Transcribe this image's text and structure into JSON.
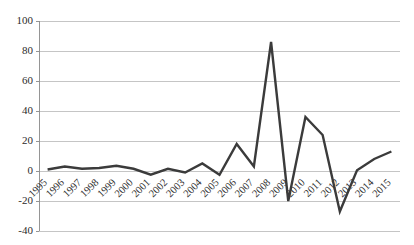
{
  "chart_data": {
    "type": "line",
    "title": "",
    "subtitle": "",
    "xlabel": "",
    "ylabel": "",
    "categories": [
      "1995",
      "1996",
      "1997",
      "1998",
      "1999",
      "2000",
      "2001",
      "2002",
      "2003",
      "2004",
      "2005",
      "2006",
      "2007",
      "2008",
      "2009",
      "2010",
      "2011",
      "2012",
      "2013",
      "2014",
      "2015"
    ],
    "series": [
      {
        "name": "",
        "values": [
          1,
          3,
          1.5,
          2,
          3.5,
          1.5,
          -2.5,
          1.5,
          -1,
          5,
          -2.5,
          18,
          3,
          86,
          -20,
          36,
          24,
          -27,
          0.5,
          8,
          13
        ]
      }
    ],
    "ylim": [
      -40,
      100
    ],
    "ytick_values": [
      -40,
      -20,
      0,
      20,
      40,
      60,
      80,
      100
    ],
    "ytick_labels": [
      "-40",
      "-20",
      "0",
      "20",
      "40",
      "60",
      "80",
      "100"
    ],
    "grid": true,
    "grid_axis": "y",
    "legend": false,
    "legend_position": "none",
    "line_color": "#3b3b3b",
    "grid_color": "#b6b6b6",
    "axis_color": "#8a8a8a",
    "background_color": "#ffffff",
    "xtick_rotation": 45
  },
  "layout": {
    "plot_left": 39,
    "plot_right": 400,
    "plot_top": 21,
    "plot_bottom": 231
  }
}
